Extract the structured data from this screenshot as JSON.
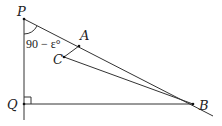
{
  "diagram": {
    "type": "geometry",
    "points": [
      {
        "id": "P",
        "label": "P",
        "x": 24,
        "y": 19
      },
      {
        "id": "Q",
        "label": "Q",
        "x": 24,
        "y": 104
      },
      {
        "id": "B",
        "label": "B",
        "x": 193,
        "y": 104
      },
      {
        "id": "A",
        "label": "A",
        "x": 79,
        "y": 46
      },
      {
        "id": "C",
        "label": "C",
        "x": 64,
        "y": 57
      }
    ],
    "angle_label": "90 − ε°",
    "right_angle_at": "Q",
    "segments": [
      "PQ",
      "QB",
      "PB",
      "AC",
      "CB"
    ]
  }
}
